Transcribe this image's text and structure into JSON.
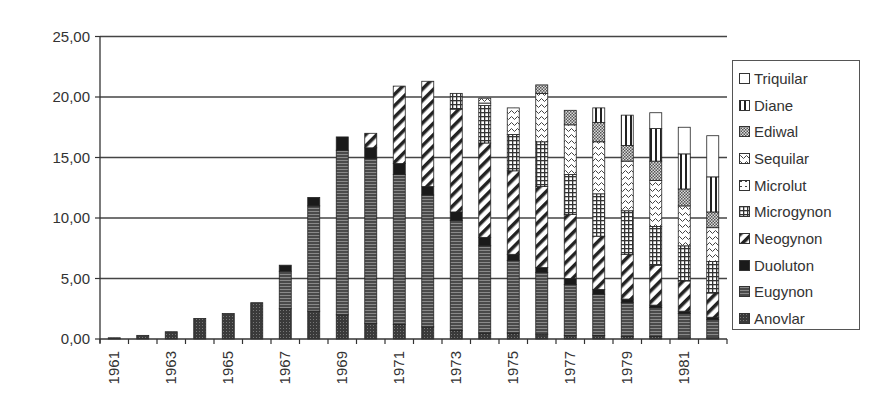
{
  "chart_data": {
    "type": "bar",
    "stacked": true,
    "title": "",
    "xlabel": "",
    "ylabel": "",
    "ylim": [
      0,
      25
    ],
    "yticks": [
      "0,00",
      "5,00",
      "10,00",
      "15,00",
      "20,00",
      "25,00"
    ],
    "grid": true,
    "legend_position": "right",
    "categories": [
      "1961",
      "1962",
      "1963",
      "1964",
      "1965",
      "1966",
      "1967",
      "1968",
      "1969",
      "1970",
      "1971",
      "1972",
      "1973",
      "1974",
      "1975",
      "1976",
      "1977",
      "1978",
      "1979",
      "1980",
      "1981",
      "1982"
    ],
    "xtick_labels_shown": [
      "1961",
      "1963",
      "1965",
      "1967",
      "1969",
      "1971",
      "1973",
      "1975",
      "1977",
      "1979",
      "1981"
    ],
    "series": [
      {
        "name": "Anovlar",
        "pattern": "dark-dots",
        "values": [
          0.1,
          0.3,
          0.6,
          1.7,
          2.1,
          3.0,
          2.5,
          2.3,
          2.0,
          1.3,
          1.2,
          1.0,
          0.7,
          0.5,
          0.5,
          0.4,
          0.3,
          0.3,
          0.2,
          0.2,
          0.1,
          0.1
        ]
      },
      {
        "name": "Eugynon",
        "pattern": "horiz-lines",
        "values": [
          0,
          0,
          0,
          0,
          0,
          0,
          3.1,
          8.7,
          13.6,
          13.6,
          12.4,
          10.9,
          9.1,
          7.2,
          6.0,
          5.1,
          4.2,
          3.4,
          2.8,
          2.4,
          2.0,
          1.5
        ]
      },
      {
        "name": "Duoluton",
        "pattern": "solid-dark",
        "values": [
          0,
          0,
          0,
          0,
          0,
          0,
          0.5,
          0.7,
          1.1,
          0.9,
          0.9,
          0.7,
          0.7,
          0.7,
          0.5,
          0.4,
          0.5,
          0.4,
          0.3,
          0.2,
          0.2,
          0.2
        ]
      },
      {
        "name": "Neogynon",
        "pattern": "diagonal",
        "values": [
          0,
          0,
          0,
          0,
          0,
          0,
          0,
          0,
          0,
          1.2,
          6.4,
          8.7,
          8.5,
          7.8,
          6.9,
          6.7,
          5.3,
          4.4,
          3.7,
          3.3,
          2.5,
          2.0
        ]
      },
      {
        "name": "Microgynon",
        "pattern": "grid",
        "values": [
          0,
          0,
          0,
          0,
          0,
          0,
          0,
          0,
          0,
          0,
          0,
          0,
          1.3,
          3.1,
          3.0,
          3.7,
          3.3,
          3.5,
          3.6,
          3.2,
          2.9,
          2.6
        ]
      },
      {
        "name": "Microlut",
        "pattern": "dotted-box",
        "values": [
          0,
          0,
          0,
          0,
          0,
          0,
          0,
          0,
          0,
          0,
          0,
          0,
          0,
          0.2,
          0,
          0,
          0,
          0,
          0,
          0,
          0,
          0
        ]
      },
      {
        "name": "Sequilar",
        "pattern": "wave",
        "values": [
          0,
          0,
          0,
          0,
          0,
          0,
          0,
          0,
          0,
          0,
          0,
          0,
          0,
          0.4,
          2.2,
          4.0,
          4.1,
          4.3,
          4.1,
          3.8,
          3.3,
          2.8
        ]
      },
      {
        "name": "Ediwal",
        "pattern": "checker-dots",
        "values": [
          0,
          0,
          0,
          0,
          0,
          0,
          0,
          0,
          0,
          0,
          0,
          0,
          0,
          0,
          0,
          0.7,
          1.2,
          1.6,
          1.3,
          1.6,
          1.4,
          1.3
        ]
      },
      {
        "name": "Diane",
        "pattern": "vertical-lines",
        "values": [
          0,
          0,
          0,
          0,
          0,
          0,
          0,
          0,
          0,
          0,
          0,
          0,
          0,
          0,
          0,
          0,
          0,
          1.2,
          2.5,
          2.7,
          2.9,
          2.9
        ]
      },
      {
        "name": "Triquilar",
        "pattern": "white",
        "values": [
          0,
          0,
          0,
          0,
          0,
          0,
          0,
          0,
          0,
          0,
          0,
          0,
          0,
          0,
          0,
          0,
          0,
          0,
          0,
          1.3,
          2.2,
          3.4
        ]
      }
    ],
    "totals": [
      0.1,
      0.3,
      0.6,
      1.7,
      2.1,
      3.0,
      6.1,
      11.7,
      16.7,
      17.0,
      20.9,
      21.3,
      20.3,
      19.9,
      19.1,
      21.0,
      18.9,
      19.1,
      18.5,
      18.7,
      17.5,
      16.8
    ]
  },
  "legend": {
    "items": [
      "Triquilar",
      "Diane",
      "Ediwal",
      "Sequilar",
      "Microlut",
      "Microgynon",
      "Neogynon",
      "Duoluton",
      "Eugynon",
      "Anovlar"
    ]
  }
}
